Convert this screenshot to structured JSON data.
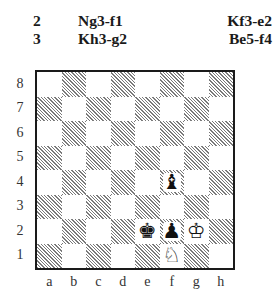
{
  "moves": [
    {
      "number": "2",
      "white": "Ng3-f1",
      "black": "Kf3-e2"
    },
    {
      "number": "3",
      "white": "Kh3-g2",
      "black": "Be5-f4"
    }
  ],
  "diagram": {
    "ranks": [
      "8",
      "7",
      "6",
      "5",
      "4",
      "3",
      "2",
      "1"
    ],
    "files": [
      "a",
      "b",
      "c",
      "d",
      "e",
      "f",
      "g",
      "h"
    ],
    "light_square_color": "#ffffff",
    "dark_square_style": "diagonal-hatch",
    "pieces": [
      {
        "square": "f4",
        "piece": "bishop",
        "color": "black",
        "glyph": "♝"
      },
      {
        "square": "e2",
        "piece": "king",
        "color": "black",
        "glyph": "♚"
      },
      {
        "square": "f2",
        "piece": "pawn",
        "color": "black",
        "glyph": "♟"
      },
      {
        "square": "g2",
        "piece": "king",
        "color": "white",
        "glyph": "♔"
      },
      {
        "square": "f1",
        "piece": "knight",
        "color": "white",
        "glyph": "♘"
      }
    ]
  }
}
